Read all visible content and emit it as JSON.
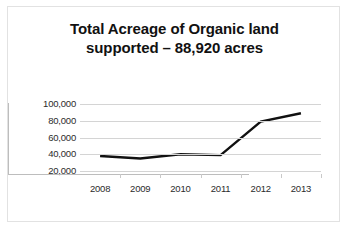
{
  "card": {
    "background": "#ffffff",
    "border_color": "#e2e2e2"
  },
  "chart_data": {
    "type": "line",
    "title": "Total Acreage of Organic land supported – 88,920 acres",
    "title_lines": [
      "Total Acreage of Organic land",
      "supported – 88,920 acres"
    ],
    "categories": [
      "2008",
      "2009",
      "2010",
      "2011",
      "2012",
      "2013"
    ],
    "values": [
      38000,
      35000,
      40000,
      39000,
      79000,
      88920
    ],
    "series": [
      {
        "name": "Total Acreage of Organic land supported",
        "values": [
          38000,
          35000,
          40000,
          39000,
          79000,
          88920
        ],
        "color": "#111111",
        "line_width": 2.4
      }
    ],
    "xlabel": "",
    "ylabel": "",
    "ylim": [
      0,
      100000
    ],
    "ytick_labels": [
      "100,000",
      "80,000",
      "60,000",
      "40,000",
      "20,000"
    ],
    "ytick_values": [
      100000,
      80000,
      60000,
      40000,
      20000
    ],
    "xtick_labels": [
      "2008",
      "2009",
      "2010",
      "2011",
      "2012",
      "2013"
    ],
    "grid": true,
    "grid_color": "#d4d4d4",
    "axis_color": "#bdbdbd",
    "legend": false,
    "legend_position": "none",
    "markers": false
  }
}
